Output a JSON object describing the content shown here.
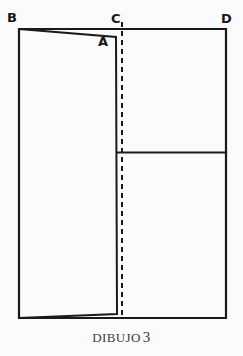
{
  "figure": {
    "caption_text": "DIBUJO",
    "caption_number": "3",
    "background_color": "#fbfbfb",
    "ink_color": "#1a1a1a",
    "labels": {
      "a": "A",
      "b": "B",
      "c": "C",
      "d": "D"
    },
    "geometry": {
      "outer_rectangle": {
        "name": "outer-rectangle",
        "left": 19,
        "top": 29,
        "right": 226,
        "bottom": 318
      },
      "dashed_line": {
        "name": "dashed-fold-line",
        "x": 122,
        "y_start": 22,
        "y_end": 318,
        "dash_pattern": "5,4"
      },
      "inner_horizontal_line": {
        "name": "inner-horizontal-divider",
        "y": 152,
        "x_start": 117,
        "x_end": 226
      },
      "quadrilateral": {
        "name": "folded-flap-quadrilateral",
        "points": "19,29 116,37 117,314 19,318"
      }
    }
  }
}
